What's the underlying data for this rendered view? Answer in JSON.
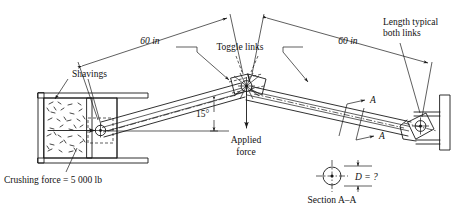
{
  "figure": {
    "accent_color": "#1a1a1a",
    "background_color": "#ffffff"
  },
  "labels": {
    "dim_left": "60 in",
    "dim_right": "60 in",
    "toggle_links": "Toggle links",
    "length_typical_line1": "Length typical",
    "length_typical_line2": "both links",
    "shavings": "Shavings",
    "crushing_force": "Crushing force  =  5 000 lb",
    "angle": "15°",
    "applied_line1": "Applied",
    "applied_line2": "force",
    "section_arrow_top": "A",
    "section_arrow_bottom": "A",
    "diameter_label": "D  =  ?",
    "section_caption": "Section A–A"
  },
  "values": {
    "link_length_in": 60,
    "link_angle_deg": 15,
    "crushing_force_lb": 5000,
    "unknown_diameter": "?"
  },
  "icons": {
    "arrow_applied": "down-arrow-icon",
    "arrow_crushing": "right-arrow-icon",
    "section_marker": "section-arrow-icon"
  }
}
